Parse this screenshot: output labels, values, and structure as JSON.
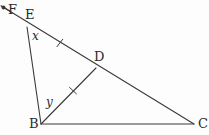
{
  "figure": {
    "kind": "geometry-diagram",
    "background_color": "#fdfdfd",
    "stroke_color": "#3a3a3a",
    "label_color": "#2b2b2b",
    "width": 209,
    "height": 135,
    "points": {
      "F": {
        "label": "F",
        "x": 3,
        "y": 7
      },
      "E": {
        "label": "E",
        "x": 27,
        "y": 27
      },
      "D": {
        "label": "D",
        "x": 96,
        "y": 68
      },
      "B": {
        "label": "B",
        "x": 41,
        "y": 124
      },
      "C": {
        "label": "C",
        "x": 194,
        "y": 124
      }
    },
    "angles": {
      "x": {
        "label": "x",
        "vertex": "E",
        "between": [
          "E-F",
          "E-B"
        ]
      },
      "y": {
        "label": "y",
        "vertex": "B",
        "between": [
          "B-E",
          "B-D"
        ]
      }
    },
    "segments": [
      {
        "name": "ray-F-to-C",
        "from": "F",
        "to": "C",
        "arrow_at_start": true,
        "dot_at_start": true,
        "ticks": 0
      },
      {
        "name": "segment-E-B",
        "from": "E",
        "to": "B",
        "ticks": 0
      },
      {
        "name": "segment-B-D",
        "from": "B",
        "to": "D",
        "ticks": 1
      },
      {
        "name": "segment-B-C",
        "from": "B",
        "to": "C",
        "ticks": 0
      }
    ],
    "tick_marks": [
      {
        "name": "tick-on-ED",
        "on": "E-D",
        "x": 60,
        "y": 43
      },
      {
        "name": "tick-on-BD",
        "on": "B-D",
        "x": 73,
        "y": 91
      }
    ]
  }
}
